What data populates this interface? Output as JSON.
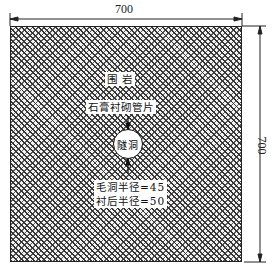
{
  "figure": {
    "width_dimension": "700",
    "height_dimension": "700",
    "labels": {
      "surrounding_rock": "围 岩",
      "lining": "石膏衬砌管片",
      "tunnel": "隧洞",
      "excavation_radius": "毛洞半径=45",
      "lined_radius": "衬后半径=50"
    },
    "colors": {
      "line": "#222222",
      "background": "#ffffff"
    }
  }
}
